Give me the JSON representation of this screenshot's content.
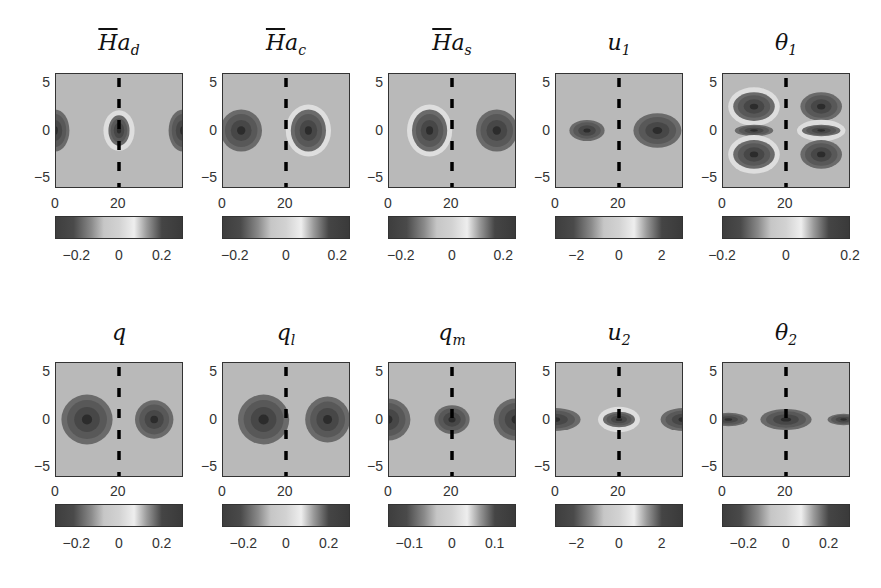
{
  "figure": {
    "rows": 2,
    "cols": 5,
    "background": "#b9b9b9",
    "dash_color": "#000000",
    "colormap": [
      "#3e3e3e",
      "#4a4a4a",
      "#8a8a8a",
      "#c6c6c6",
      "#d2d2d2",
      "#eeeeee",
      "#9a9a9a",
      "#454545",
      "#3a3a3a"
    ]
  },
  "chart_data": [
    {
      "type": "heatmap",
      "title": "H̄a_d",
      "xlabel": "",
      "ylabel": "",
      "x_ticks": [
        "0",
        "20"
      ],
      "y_ticks": [
        "5",
        "0",
        "−5"
      ],
      "xlim": [
        0,
        40
      ],
      "ylim": [
        -6,
        6
      ],
      "colorbar_ticks": [
        "−0.2",
        "0",
        "0.2"
      ],
      "colorbar_range": [
        -0.3,
        0.3
      ],
      "dashed_line_x": 20,
      "features": [
        {
          "x": 0,
          "y": 0,
          "rx": 4.5,
          "ry": 2.2,
          "sign": "neg"
        },
        {
          "x": 20,
          "y": 0,
          "rx": 3.3,
          "ry": 1.6,
          "sign": "neg",
          "halo": true
        },
        {
          "x": 40,
          "y": 0,
          "rx": 4.5,
          "ry": 2.2,
          "sign": "neg"
        }
      ]
    },
    {
      "type": "heatmap",
      "title": "H̄a_c",
      "x_ticks": [
        "0",
        "20"
      ],
      "y_ticks": [
        "5",
        "0",
        "−5"
      ],
      "xlim": [
        0,
        40
      ],
      "ylim": [
        -6,
        6
      ],
      "colorbar_ticks": [
        "−0.2",
        "0",
        "0.2"
      ],
      "colorbar_range": [
        -0.25,
        0.25
      ],
      "dashed_line_x": 20,
      "features": [
        {
          "x": 6,
          "y": 0,
          "rx": 6.5,
          "ry": 2.2,
          "sign": "neg"
        },
        {
          "x": 27,
          "y": 0,
          "rx": 5.5,
          "ry": 2.2,
          "sign": "neg",
          "halo": true
        }
      ]
    },
    {
      "type": "heatmap",
      "title": "H̄a_s",
      "x_ticks": [
        "0",
        "20"
      ],
      "y_ticks": [
        "5",
        "0",
        "−5"
      ],
      "xlim": [
        0,
        40
      ],
      "ylim": [
        -6,
        6
      ],
      "colorbar_ticks": [
        "−0.2",
        "0",
        "0.2"
      ],
      "colorbar_range": [
        -0.25,
        0.25
      ],
      "dashed_line_x": 20,
      "features": [
        {
          "x": 13,
          "y": 0,
          "rx": 5.5,
          "ry": 2.2,
          "sign": "neg",
          "halo": true
        },
        {
          "x": 34,
          "y": 0,
          "rx": 6.5,
          "ry": 2.2,
          "sign": "neg"
        }
      ]
    },
    {
      "type": "heatmap",
      "title": "u_1",
      "x_ticks": [
        "0",
        "20"
      ],
      "y_ticks": [
        "5",
        "0",
        "−5"
      ],
      "xlim": [
        0,
        40
      ],
      "ylim": [
        -6,
        6
      ],
      "colorbar_ticks": [
        "−2",
        "0",
        "2"
      ],
      "colorbar_range": [
        -3,
        3
      ],
      "dashed_line_x": 20,
      "features": [
        {
          "x": 10,
          "y": 0,
          "rx": 5.5,
          "ry": 1.1,
          "sign": "neg"
        },
        {
          "x": 32,
          "y": 0,
          "rx": 7.5,
          "ry": 1.8,
          "sign": "neg"
        }
      ]
    },
    {
      "type": "heatmap",
      "title": "θ_1",
      "x_ticks": [
        "0",
        "20"
      ],
      "y_ticks": [
        "5",
        "0",
        "−5"
      ],
      "xlim": [
        0,
        40
      ],
      "ylim": [
        -6,
        6
      ],
      "colorbar_ticks": [
        "−0.2",
        "0",
        "0.2"
      ],
      "colorbar_range": [
        -0.2,
        0.2
      ],
      "dashed_line_x": 20,
      "features": [
        {
          "x": 10,
          "y": 2.5,
          "rx": 6.5,
          "ry": 1.5,
          "sign": "neg",
          "halo": true
        },
        {
          "x": 10,
          "y": 0,
          "rx": 6,
          "ry": 0.6,
          "sign": "neg"
        },
        {
          "x": 10,
          "y": -2.5,
          "rx": 6.5,
          "ry": 1.5,
          "sign": "neg",
          "halo": true
        },
        {
          "x": 31,
          "y": 2.5,
          "rx": 6.5,
          "ry": 1.5,
          "sign": "neg"
        },
        {
          "x": 31,
          "y": 0,
          "rx": 6,
          "ry": 0.6,
          "sign": "neg",
          "halo": true
        },
        {
          "x": 31,
          "y": -2.5,
          "rx": 6.5,
          "ry": 1.5,
          "sign": "neg"
        }
      ]
    },
    {
      "type": "heatmap",
      "title": "q",
      "x_ticks": [
        "0",
        "20"
      ],
      "y_ticks": [
        "5",
        "0",
        "−5"
      ],
      "xlim": [
        0,
        40
      ],
      "ylim": [
        -6,
        6
      ],
      "colorbar_ticks": [
        "−0.2",
        "0",
        "0.2"
      ],
      "colorbar_range": [
        -0.3,
        0.3
      ],
      "dashed_line_x": 20,
      "features": [
        {
          "x": 10,
          "y": 0,
          "rx": 8,
          "ry": 2.6,
          "sign": "neg"
        },
        {
          "x": 31,
          "y": 0,
          "rx": 6,
          "ry": 2,
          "sign": "neg"
        }
      ]
    },
    {
      "type": "heatmap",
      "title": "q_l",
      "x_ticks": [
        "0",
        "20"
      ],
      "y_ticks": [
        "5",
        "0",
        "−5"
      ],
      "xlim": [
        0,
        40
      ],
      "ylim": [
        -6,
        6
      ],
      "colorbar_ticks": [
        "−0.2",
        "0",
        "0.2"
      ],
      "colorbar_range": [
        -0.3,
        0.3
      ],
      "dashed_line_x": 20,
      "features": [
        {
          "x": 13,
          "y": 0,
          "rx": 8,
          "ry": 2.6,
          "sign": "neg"
        },
        {
          "x": 33,
          "y": 0,
          "rx": 7,
          "ry": 2.4,
          "sign": "neg"
        }
      ]
    },
    {
      "type": "heatmap",
      "title": "q_m",
      "x_ticks": [
        "0",
        "20"
      ],
      "y_ticks": [
        "5",
        "0",
        "−5"
      ],
      "xlim": [
        0,
        40
      ],
      "ylim": [
        -6,
        6
      ],
      "colorbar_ticks": [
        "−0.1",
        "0",
        "0.1"
      ],
      "colorbar_range": [
        -0.15,
        0.15
      ],
      "dashed_line_x": 20,
      "features": [
        {
          "x": 0,
          "y": 0,
          "rx": 7,
          "ry": 2.2,
          "sign": "neg"
        },
        {
          "x": 20,
          "y": 0,
          "rx": 5.5,
          "ry": 1.5,
          "sign": "neg"
        },
        {
          "x": 40,
          "y": 0,
          "rx": 7,
          "ry": 2.2,
          "sign": "neg"
        }
      ]
    },
    {
      "type": "heatmap",
      "title": "u_2",
      "x_ticks": [
        "0",
        "20"
      ],
      "y_ticks": [
        "5",
        "0",
        "−5"
      ],
      "xlim": [
        0,
        40
      ],
      "ylim": [
        -6,
        6
      ],
      "colorbar_ticks": [
        "−2",
        "0",
        "2"
      ],
      "colorbar_range": [
        -3,
        3
      ],
      "dashed_line_x": 20,
      "features": [
        {
          "x": 0,
          "y": 0,
          "rx": 8,
          "ry": 1.2,
          "sign": "neg"
        },
        {
          "x": 20,
          "y": 0,
          "rx": 5,
          "ry": 0.8,
          "sign": "neg",
          "halo": true
        },
        {
          "x": 40,
          "y": 0,
          "rx": 7,
          "ry": 1.2,
          "sign": "neg"
        }
      ]
    },
    {
      "type": "heatmap",
      "title": "θ_2",
      "x_ticks": [
        "0",
        "20"
      ],
      "y_ticks": [
        "5",
        "0",
        "−5"
      ],
      "xlim": [
        0,
        40
      ],
      "ylim": [
        -6,
        6
      ],
      "colorbar_ticks": [
        "−0.2",
        "0",
        "0.2"
      ],
      "colorbar_range": [
        -0.3,
        0.3
      ],
      "dashed_line_x": 20,
      "features": [
        {
          "x": 2,
          "y": 0,
          "rx": 6,
          "ry": 0.7,
          "sign": "neg"
        },
        {
          "x": 20,
          "y": 0,
          "rx": 8,
          "ry": 1.1,
          "sign": "neg"
        },
        {
          "x": 38,
          "y": 0,
          "rx": 5,
          "ry": 0.6,
          "sign": "neg"
        }
      ]
    }
  ],
  "panels": [
    {
      "title_main": "H",
      "title_sub": "d",
      "bar": true,
      "y_ticks": [
        "5",
        "0",
        "−5"
      ],
      "x_ticks": [
        "0",
        "20"
      ],
      "cbar_ticks": [
        "−0.2",
        "0",
        "0.2"
      ]
    },
    {
      "title_main": "H",
      "title_sub": "c",
      "bar": true,
      "y_ticks": [
        "5",
        "0",
        "−5"
      ],
      "x_ticks": [
        "0",
        "20"
      ],
      "cbar_ticks": [
        "−0.2",
        "0",
        "0.2"
      ]
    },
    {
      "title_main": "H",
      "title_sub": "s",
      "bar": true,
      "y_ticks": [
        "5",
        "0",
        "−5"
      ],
      "x_ticks": [
        "0",
        "20"
      ],
      "cbar_ticks": [
        "−0.2",
        "0",
        "0.2"
      ]
    },
    {
      "title_main": "u",
      "title_sub": "1",
      "bar": false,
      "y_ticks": [
        "5",
        "0",
        "−5"
      ],
      "x_ticks": [
        "0",
        "20"
      ],
      "cbar_ticks": [
        "−2",
        "0",
        "2"
      ]
    },
    {
      "title_main": "θ",
      "title_sub": "1",
      "bar": false,
      "y_ticks": [
        "5",
        "0",
        "−5"
      ],
      "x_ticks": [
        "0",
        "20"
      ],
      "cbar_ticks": [
        "−0.2",
        "0",
        "0.2"
      ]
    },
    {
      "title_main": "q",
      "title_sub": "",
      "bar": false,
      "y_ticks": [
        "5",
        "0",
        "−5"
      ],
      "x_ticks": [
        "0",
        "20"
      ],
      "cbar_ticks": [
        "−0.2",
        "0",
        "0.2"
      ]
    },
    {
      "title_main": "q",
      "title_sub": "l",
      "bar": false,
      "y_ticks": [
        "5",
        "0",
        "−5"
      ],
      "x_ticks": [
        "0",
        "20"
      ],
      "cbar_ticks": [
        "−0.2",
        "0",
        "0.2"
      ]
    },
    {
      "title_main": "q",
      "title_sub": "m",
      "bar": false,
      "y_ticks": [
        "5",
        "0",
        "−5"
      ],
      "x_ticks": [
        "0",
        "20"
      ],
      "cbar_ticks": [
        "−0.1",
        "0",
        "0.1"
      ]
    },
    {
      "title_main": "u",
      "title_sub": "2",
      "bar": false,
      "y_ticks": [
        "5",
        "0",
        "−5"
      ],
      "x_ticks": [
        "0",
        "20"
      ],
      "cbar_ticks": [
        "−2",
        "0",
        "2"
      ]
    },
    {
      "title_main": "θ",
      "title_sub": "2",
      "bar": false,
      "y_ticks": [
        "5",
        "0",
        "−5"
      ],
      "x_ticks": [
        "0",
        "20"
      ],
      "cbar_ticks": [
        "−0.2",
        "0",
        "0.2"
      ]
    }
  ]
}
